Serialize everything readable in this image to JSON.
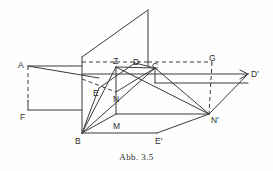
{
  "figure": {
    "caption": "Abb. 3.5",
    "stroke_color": "#3a3a3a",
    "background_color": "#fefefe",
    "label_color": "#2b2b2b",
    "vertices": [
      {
        "name": "A",
        "label": "A",
        "x": 28,
        "y": 66,
        "lx": 18,
        "ly": 61
      },
      {
        "name": "F",
        "label": "F",
        "x": 28,
        "y": 110,
        "lx": 20,
        "ly": 113
      },
      {
        "name": "B",
        "label": "B",
        "x": 82,
        "y": 133,
        "lx": 75,
        "ly": 137
      },
      {
        "name": "E",
        "label": "E",
        "x": 99,
        "y": 88,
        "lx": 93,
        "ly": 89
      },
      {
        "name": "Z",
        "label": "Z",
        "x": 116,
        "y": 67,
        "lx": 113,
        "ly": 57
      },
      {
        "name": "N",
        "label": "N",
        "x": 116,
        "y": 92,
        "lx": 113,
        "ly": 95
      },
      {
        "name": "M",
        "label": "M",
        "x": 116,
        "y": 114,
        "lx": 113,
        "ly": 122
      },
      {
        "name": "D",
        "label": "D",
        "x": 135,
        "y": 63,
        "lx": 133,
        "ly": 58
      },
      {
        "name": "C",
        "label": "C",
        "x": 155,
        "y": 68,
        "lx": 152,
        "ly": 62
      },
      {
        "name": "G",
        "label": "G",
        "x": 212,
        "y": 62,
        "lx": 209,
        "ly": 54
      },
      {
        "name": "Dp",
        "label": "D'",
        "x": 248,
        "y": 74,
        "lx": 251,
        "ly": 70
      },
      {
        "name": "Np",
        "label": "N'",
        "x": 209,
        "y": 114,
        "lx": 211,
        "ly": 116
      },
      {
        "name": "Ep",
        "label": "E'",
        "x": 157,
        "y": 133,
        "lx": 155,
        "ly": 137
      }
    ],
    "solid_segments": [
      {
        "name": "plane-left-edge",
        "x1": 82,
        "y1": 57,
        "x2": 82,
        "y2": 133
      },
      {
        "name": "plane-top-slant",
        "x1": 82,
        "y1": 57,
        "x2": 148,
        "y2": 10
      },
      {
        "name": "plane-apex-vertical",
        "x1": 148,
        "y1": 10,
        "x2": 148,
        "y2": 66
      },
      {
        "name": "A-to-vertical-plane",
        "x1": 28,
        "y1": 66,
        "x2": 82,
        "y2": 66
      },
      {
        "name": "A-to-M-ray",
        "x1": 28,
        "y1": 66,
        "x2": 99,
        "y2": 78
      },
      {
        "name": "A-F-vertical-solid",
        "x1": 28,
        "y1": 100,
        "x2": 28,
        "y2": 110
      },
      {
        "name": "F-baseline",
        "x1": 28,
        "y1": 110,
        "x2": 82,
        "y2": 110
      },
      {
        "name": "Z-N-M-vertical",
        "x1": 116,
        "y1": 67,
        "x2": 116,
        "y2": 114
      },
      {
        "name": "Z-to-C",
        "x1": 116,
        "y1": 67,
        "x2": 155,
        "y2": 68
      },
      {
        "name": "Z-to-Np",
        "x1": 116,
        "y1": 67,
        "x2": 209,
        "y2": 114
      },
      {
        "name": "B-to-Z",
        "x1": 82,
        "y1": 133,
        "x2": 116,
        "y2": 67
      },
      {
        "name": "B-to-E",
        "x1": 82,
        "y1": 133,
        "x2": 99,
        "y2": 88
      },
      {
        "name": "B-to-C",
        "x1": 82,
        "y1": 133,
        "x2": 155,
        "y2": 68
      },
      {
        "name": "B-to-M",
        "x1": 82,
        "y1": 133,
        "x2": 116,
        "y2": 114
      },
      {
        "name": "B-to-Ep",
        "x1": 82,
        "y1": 133,
        "x2": 157,
        "y2": 133
      },
      {
        "name": "Ep-to-Np",
        "x1": 157,
        "y1": 133,
        "x2": 209,
        "y2": 114
      },
      {
        "name": "M-to-Np",
        "x1": 116,
        "y1": 114,
        "x2": 209,
        "y2": 114
      },
      {
        "name": "Np-to-Dp",
        "x1": 209,
        "y1": 114,
        "x2": 248,
        "y2": 74
      },
      {
        "name": "plane-line-to-Dp",
        "x1": 82,
        "y1": 74,
        "x2": 248,
        "y2": 74
      },
      {
        "name": "N-to-C",
        "x1": 116,
        "y1": 92,
        "x2": 155,
        "y2": 68
      },
      {
        "name": "E-to-D",
        "x1": 99,
        "y1": 88,
        "x2": 135,
        "y2": 63
      },
      {
        "name": "D-to-C",
        "x1": 135,
        "y1": 63,
        "x2": 155,
        "y2": 68
      },
      {
        "name": "C-to-Np",
        "x1": 155,
        "y1": 68,
        "x2": 209,
        "y2": 114
      },
      {
        "name": "C-vertical-stub",
        "x1": 155,
        "y1": 68,
        "x2": 155,
        "y2": 83
      },
      {
        "name": "C-horizontal-right",
        "x1": 155,
        "y1": 83,
        "x2": 248,
        "y2": 83
      },
      {
        "name": "arrow-head-Dp-upper",
        "x1": 240,
        "y1": 70,
        "x2": 248,
        "y2": 74
      },
      {
        "name": "arrow-head-Dp-lower",
        "x1": 240,
        "y1": 79,
        "x2": 248,
        "y2": 74
      }
    ],
    "dashed_segments": [
      {
        "name": "A-F-vertical-dashed",
        "x1": 28,
        "y1": 66,
        "x2": 28,
        "y2": 102
      },
      {
        "name": "Z-dashed-left",
        "x1": 82,
        "y1": 62,
        "x2": 116,
        "y2": 62
      },
      {
        "name": "Z-to-D-dashed",
        "x1": 116,
        "y1": 62,
        "x2": 148,
        "y2": 62
      },
      {
        "name": "D-to-G-dashed",
        "x1": 148,
        "y1": 62,
        "x2": 212,
        "y2": 62
      },
      {
        "name": "G-vertical-dashed",
        "x1": 212,
        "y1": 62,
        "x2": 209,
        "y2": 114
      },
      {
        "name": "A-ray-dashed-to-N",
        "x1": 82,
        "y1": 79,
        "x2": 116,
        "y2": 92
      }
    ]
  }
}
